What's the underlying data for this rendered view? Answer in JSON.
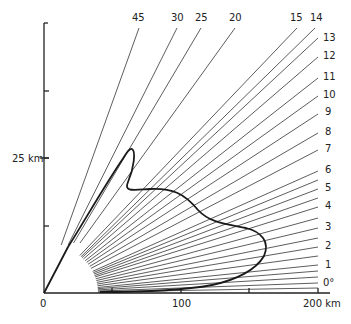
{
  "chart_data": {
    "type": "diagram",
    "title": "",
    "x_axis": {
      "label": "km",
      "ticks": [
        {
          "value": 0,
          "label": "0",
          "px": 44
        },
        {
          "value": 50,
          "label": "",
          "px": 112
        },
        {
          "value": 100,
          "label": "100",
          "px": 181
        },
        {
          "value": 150,
          "label": "",
          "px": 249
        },
        {
          "value": 200,
          "label": "200 km",
          "px": 318
        }
      ],
      "range": [
        0,
        210
      ]
    },
    "y_axis": {
      "label": "km",
      "ticks": [
        {
          "value": 0,
          "label": "",
          "py": 293
        },
        {
          "value": 12.5,
          "label": "",
          "py": 226
        },
        {
          "value": 25,
          "label": "25 km",
          "py": 158
        },
        {
          "value": 37.5,
          "label": "",
          "py": 91
        },
        {
          "value": 50,
          "label": "",
          "py": 23
        }
      ],
      "range": [
        0,
        50
      ]
    },
    "origin_px": [
      44,
      293
    ],
    "shadow_ellipse_px": {
      "rx": 54,
      "ry": 50
    },
    "rays": [
      {
        "angle": "45",
        "label": "45",
        "end": [
          139,
          28
        ],
        "start_min_y": 245,
        "label_pos": [
          132,
          21
        ]
      },
      {
        "angle": "30",
        "label": "30",
        "end": [
          177,
          28
        ],
        "start_min_y": 245,
        "label_pos": [
          171,
          21
        ]
      },
      {
        "angle": "25",
        "label": "25",
        "end": [
          201,
          28
        ],
        "start_min_y": 243,
        "label_pos": [
          195,
          21
        ]
      },
      {
        "angle": "20",
        "label": "20",
        "end": [
          235,
          28
        ],
        "start_min_y": 243,
        "label_pos": [
          229,
          21
        ]
      },
      {
        "angle": "15",
        "label": "15",
        "end": [
          297,
          28
        ],
        "label_pos": [
          290,
          21
        ]
      },
      {
        "angle": "14",
        "label": "14",
        "end": [
          315,
          28
        ],
        "label_pos": [
          310,
          21
        ]
      },
      {
        "angle": "13",
        "label": "13",
        "end": [
          318,
          38
        ],
        "label_pos": [
          323,
          41
        ]
      },
      {
        "angle": "12",
        "label": "12",
        "end": [
          318,
          57
        ],
        "label_pos": [
          323,
          59
        ]
      },
      {
        "angle": "11",
        "label": "11",
        "end": [
          318,
          78
        ],
        "label_pos": [
          323,
          80
        ]
      },
      {
        "angle": "10",
        "label": "10",
        "end": [
          318,
          96
        ],
        "label_pos": [
          323,
          98
        ]
      },
      {
        "angle": "9",
        "label": "9",
        "end": [
          318,
          114
        ],
        "label_pos": [
          325,
          115
        ]
      },
      {
        "angle": "8",
        "label": "8",
        "end": [
          318,
          133
        ],
        "label_pos": [
          325,
          135
        ]
      },
      {
        "angle": "7",
        "label": "7",
        "end": [
          318,
          150
        ],
        "label_pos": [
          325,
          152
        ]
      },
      {
        "angle": "6",
        "label": "6",
        "end": [
          318,
          171
        ],
        "label_pos": [
          325,
          173
        ]
      },
      {
        "angle": "5.5",
        "label": "",
        "end": [
          318,
          180
        ]
      },
      {
        "angle": "5",
        "label": "5",
        "end": [
          318,
          189
        ],
        "label_pos": [
          325,
          191
        ]
      },
      {
        "angle": "4.5",
        "label": "",
        "end": [
          318,
          198
        ]
      },
      {
        "angle": "4",
        "label": "4",
        "end": [
          318,
          207
        ],
        "label_pos": [
          325,
          209
        ]
      },
      {
        "angle": "3.5",
        "label": "",
        "end": [
          318,
          218
        ]
      },
      {
        "angle": "3",
        "label": "3",
        "end": [
          318,
          228
        ],
        "label_pos": [
          325,
          230
        ]
      },
      {
        "angle": "2.5",
        "label": "",
        "end": [
          318,
          238
        ]
      },
      {
        "angle": "2",
        "label": "2",
        "end": [
          318,
          247
        ],
        "label_pos": [
          325,
          249
        ]
      },
      {
        "angle": "1.5",
        "label": "",
        "end": [
          318,
          256
        ]
      },
      {
        "angle": "1",
        "label": "1",
        "end": [
          318,
          265
        ],
        "label_pos": [
          325,
          268
        ]
      },
      {
        "angle": "0.7",
        "label": "",
        "end": [
          318,
          271
        ]
      },
      {
        "angle": "0.3",
        "label": "",
        "end": [
          318,
          277
        ]
      },
      {
        "angle": "0",
        "label": "0°",
        "end": [
          318,
          283
        ],
        "label_pos": [
          323,
          286
        ]
      },
      {
        "angle": "-0.3",
        "label": "",
        "end": [
          318,
          288
        ]
      }
    ],
    "contour_path": "M44,293 L68,247 C85,220 105,185 122,160 C126,154 129,148 132,149 C136,151 134,168 128,182 C124,192 132,190 150,189 C172,188 184,193 198,210 C210,223 226,224 246,228 C262,232 270,242 264,256 C256,270 236,280 212,285 C180,291 140,292 100,292",
    "annotations": [
      "45",
      "30",
      "25",
      "20",
      "15",
      "14",
      "13",
      "12",
      "11",
      "10",
      "9",
      "8",
      "7",
      "6",
      "5",
      "4",
      "3",
      "2",
      "1",
      "0°",
      "25 km",
      "0",
      "100",
      "200 km"
    ]
  }
}
